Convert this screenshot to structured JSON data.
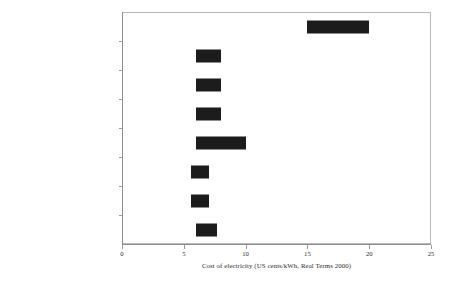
{
  "chart_data": {
    "type": "bar",
    "orientation": "horizontal",
    "subtype": "range-bar",
    "title": "",
    "xlabel": "Cost of electricity (US cents/kWh, Real Terms 2000)",
    "ylabel": "",
    "xlim": [
      0,
      25
    ],
    "xticks": [
      0,
      5,
      10,
      15,
      20,
      25
    ],
    "xtick_labels": [
      "0",
      "5",
      "10",
      "15",
      "20",
      "25"
    ],
    "grid": false,
    "legend": false,
    "bar_color": "#1c1c1c",
    "frame_color": "#b9b9b9",
    "axis_color": "#8d8d8d",
    "categories": [
      "Solar-photovoltaics",
      "Biomass",
      "Wind",
      "Hydro",
      "Nuclear",
      "Natural gas combined cycle",
      "Integrated gasification combined cycle (coal)",
      "Pulverized coal"
    ],
    "category_lines": [
      [
        "Solar-photovoltaics"
      ],
      [
        "Biomass"
      ],
      [
        "Wind"
      ],
      [
        "Hydro"
      ],
      [
        "Nuclear"
      ],
      [
        "Natural gas combined cycle"
      ],
      [
        "Integrated gasification combined",
        "cycle (coal)"
      ],
      [
        "Pulverized coal"
      ]
    ],
    "ranges": [
      {
        "category": "Solar-photovoltaics",
        "low": 15.0,
        "high": 20.0
      },
      {
        "category": "Biomass",
        "low": 6.0,
        "high": 8.0
      },
      {
        "category": "Wind",
        "low": 6.0,
        "high": 8.0
      },
      {
        "category": "Hydro",
        "low": 6.0,
        "high": 8.0
      },
      {
        "category": "Nuclear",
        "low": 6.0,
        "high": 10.0
      },
      {
        "category": "Natural gas combined cycle",
        "low": 5.6,
        "high": 7.0
      },
      {
        "category": "Integrated gasification combined cycle (coal)",
        "low": 5.6,
        "high": 7.0
      },
      {
        "category": "Pulverized coal",
        "low": 6.0,
        "high": 7.7
      }
    ]
  }
}
